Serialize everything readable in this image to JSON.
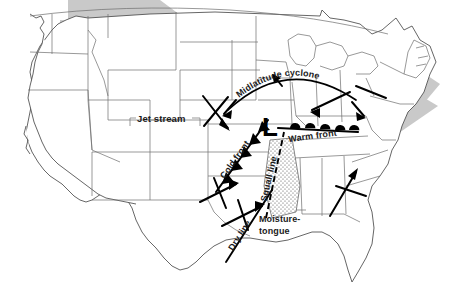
{
  "figure": {
    "name": "midlatitude-cyclone-severe-weather-map",
    "region": "United States"
  },
  "labels": {
    "jet_stream": "Jet stream",
    "midlatitude_cyclone": "Midlatitude cyclone",
    "cold_front": "Cold front",
    "warm_front": "Warm front",
    "squall_line": "Squall line",
    "dry_line": "Dry line",
    "moisture_tongue_line1": "Moisture-",
    "moisture_tongue_line2": "tongue",
    "low_center": "L"
  },
  "colors": {
    "jet_band": "#c9c9c9",
    "coastline": "#4a4a4a",
    "state_border": "#6d6d6d",
    "front_stroke": "#000000",
    "label_text": "#1a1a1a",
    "background": "#ffffff",
    "moisture_stipple": "#555555"
  },
  "features": [
    {
      "id": "jet-stream-band",
      "type": "shaded-band",
      "label": "Jet stream",
      "direction": "west-southwest to east-northeast",
      "terminator": "arrowhead over New England"
    },
    {
      "id": "cold-front",
      "type": "front",
      "symbol": "filled-triangles",
      "label": "Cold front",
      "orientation": "northeast-southwest"
    },
    {
      "id": "warm-front",
      "type": "front",
      "symbol": "filled-semicircles",
      "label": "Warm front",
      "orientation": "west-east"
    },
    {
      "id": "squall-line",
      "type": "dashed-line",
      "label": "Squall line",
      "orientation": "north-south ahead of cold front"
    },
    {
      "id": "dry-line",
      "type": "line",
      "label": "Dry line",
      "orientation": "northeast-southwest over Texas"
    },
    {
      "id": "moisture-tongue",
      "type": "stippled-region",
      "label": "Moisture-tongue",
      "location": "lower Mississippi valley"
    },
    {
      "id": "low-pressure-center",
      "type": "pressure-center",
      "label": "L",
      "location": "upper Midwest"
    },
    {
      "id": "cyclone-circulation-arc",
      "type": "arc-with-arrows",
      "label": "Midlatitude cyclone",
      "rotation": "counterclockwise"
    }
  ]
}
